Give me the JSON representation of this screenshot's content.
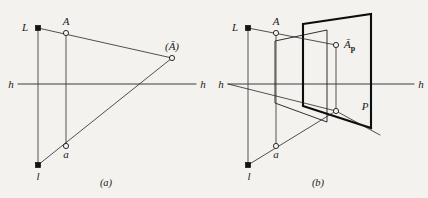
{
  "figure": {
    "background_color": "#f4f2ee",
    "ink_color": "#1a1a1a",
    "width": 428,
    "height": 198
  },
  "panel_a": {
    "caption": "(a)",
    "labels": {
      "center_of_projection": "L",
      "object_point": "A",
      "image_point": "(Ā)",
      "horizon_left": "h",
      "horizon_right": "h",
      "ground_center": "l",
      "ground_point": "a"
    },
    "points": [
      {
        "name": "L",
        "label": "L",
        "x": 38,
        "y": 28,
        "marker": "filled-square"
      },
      {
        "name": "A",
        "label": "A",
        "x": 66,
        "y": 33,
        "marker": "open-circle"
      },
      {
        "name": "Abar",
        "label": "(Ā)",
        "x": 172,
        "y": 58,
        "marker": "open-circle"
      },
      {
        "name": "a",
        "label": "a",
        "x": 66,
        "y": 146,
        "marker": "open-circle"
      },
      {
        "name": "l",
        "label": "l",
        "x": 38,
        "y": 165,
        "marker": "filled-square"
      }
    ],
    "horizon_y": 84
  },
  "panel_b": {
    "caption": "(b)",
    "labels": {
      "center_of_projection": "L",
      "object_point": "A",
      "image_point": "Ā",
      "image_point_subscript": "p",
      "plane_label": "P",
      "horizon_left": "h",
      "horizon_right": "h",
      "ground_center": "l",
      "ground_point": "a"
    },
    "points": [
      {
        "name": "L",
        "label": "L",
        "x": 248,
        "y": 28,
        "marker": "filled-square"
      },
      {
        "name": "A",
        "label": "A",
        "x": 276,
        "y": 33,
        "marker": "open-circle"
      },
      {
        "name": "Abar_p",
        "label": "Ā",
        "x": 336,
        "y": 45,
        "marker": "open-circle"
      },
      {
        "name": "foot",
        "label": "",
        "x": 336,
        "y": 111,
        "marker": "open-circle"
      },
      {
        "name": "a",
        "label": "a",
        "x": 276,
        "y": 146,
        "marker": "open-circle"
      },
      {
        "name": "l",
        "label": "l",
        "x": 248,
        "y": 165,
        "marker": "filled-square"
      }
    ],
    "horizon_y": 84,
    "front_plane": {
      "label": "",
      "corners": "(303,24) (371,14) (371,128) (303,106)"
    },
    "back_plane": {
      "label": "P",
      "corners": "(275,41) (327,30) (327,122) (275,103)"
    }
  }
}
